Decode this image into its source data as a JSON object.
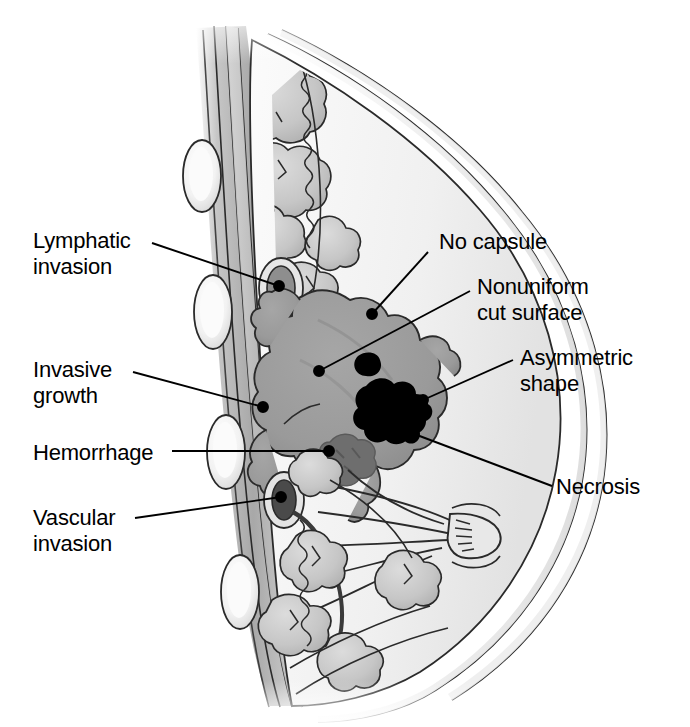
{
  "figure": {
    "background_color": "#ffffff",
    "text_color": "#000000",
    "leader_color": "#000000"
  },
  "palette": {
    "skin_light": "#f2f2f2",
    "fat_tissue": "#ededed",
    "glandular_lobule": "#c9c9c9",
    "muscle_chest_wall": "#b0b0b0",
    "rib_bone": "#f0f0f0",
    "tumor_mass": "#9a9a9a",
    "hemorrhage": "#6e6e6e",
    "necrosis": "#000000",
    "vessel_dark": "#555555",
    "outline": "#1a1a1a"
  },
  "labels": [
    {
      "id": "lymphatic-invasion",
      "text_lines": [
        "Lymphatic",
        "invasion"
      ],
      "side": "left",
      "text_x": 33,
      "text_y": 228,
      "leader": {
        "x1": 152,
        "y1": 243,
        "x2": 279,
        "y2": 286
      },
      "dot": {
        "cx": 279,
        "cy": 286,
        "r": 5
      }
    },
    {
      "id": "invasive-growth",
      "text_lines": [
        "Invasive",
        "growth"
      ],
      "side": "left",
      "text_x": 33,
      "text_y": 357,
      "leader": {
        "x1": 133,
        "y1": 372,
        "x2": 263,
        "y2": 407
      },
      "dot": {
        "cx": 263,
        "cy": 407,
        "r": 5
      }
    },
    {
      "id": "hemorrhage",
      "text_lines": [
        "Hemorrhage"
      ],
      "side": "left",
      "text_x": 33,
      "text_y": 440,
      "leader": {
        "x1": 172,
        "y1": 451,
        "x2": 329,
        "y2": 451
      },
      "dot": {
        "cx": 329,
        "cy": 451,
        "r": 5
      }
    },
    {
      "id": "vascular-invasion",
      "text_lines": [
        "Vascular",
        "invasion"
      ],
      "side": "left",
      "text_x": 33,
      "text_y": 505,
      "leader": {
        "x1": 135,
        "y1": 518,
        "x2": 281,
        "y2": 497
      },
      "dot": {
        "cx": 281,
        "cy": 497,
        "r": 5
      }
    },
    {
      "id": "no-capsule",
      "text_lines": [
        "No capsule"
      ],
      "side": "right",
      "text_x": 439,
      "text_y": 229,
      "leader": {
        "x1": 428,
        "y1": 252,
        "x2": 372,
        "y2": 314
      },
      "dot": {
        "cx": 372,
        "cy": 314,
        "r": 5
      }
    },
    {
      "id": "nonuniform-cut-surface",
      "text_lines": [
        "Nonuniform",
        "cut surface"
      ],
      "side": "right",
      "text_x": 477,
      "text_y": 274,
      "leader": {
        "x1": 470,
        "y1": 291,
        "x2": 319,
        "y2": 371
      },
      "dot": {
        "cx": 319,
        "cy": 371,
        "r": 5
      }
    },
    {
      "id": "asymmetric-shape",
      "text_lines": [
        "Asymmetric",
        "shape"
      ],
      "side": "right",
      "text_x": 520,
      "text_y": 345,
      "leader": {
        "x1": 513,
        "y1": 360,
        "x2": 423,
        "y2": 400
      },
      "dot": {
        "cx": 423,
        "cy": 400,
        "r": 5
      }
    },
    {
      "id": "necrosis",
      "text_lines": [
        "Necrosis"
      ],
      "side": "right",
      "text_x": 556,
      "text_y": 474,
      "leader": {
        "x1": 552,
        "y1": 486,
        "x2": 409,
        "y2": 432
      },
      "dot": {
        "cx": 409,
        "cy": 432,
        "r": 5
      }
    }
  ],
  "anatomy": {
    "structures": [
      "skin",
      "subcutaneous-fat",
      "glandular-lobules",
      "lactiferous-ducts",
      "nipple",
      "pectoral-muscle",
      "ribs",
      "lymphatic-vessel",
      "blood-vessel",
      "tumor-mass"
    ],
    "rib_count": 4
  }
}
